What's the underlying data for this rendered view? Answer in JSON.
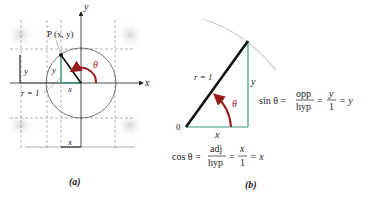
{
  "colors": {
    "angle": "#9b1c1c",
    "legs": "#3a9a7a",
    "radius": "#111111",
    "grid": "#9a9a9a",
    "circle": "#555555",
    "arc_b": "#cccccc"
  },
  "panel_a": {
    "caption": "(a)",
    "point_label": "P (x, y)",
    "axis_x": "x",
    "axis_y": "y",
    "theta": "θ",
    "radius_label": "r = 1",
    "leg_x": "x",
    "leg_y": "y",
    "bracket_y": "y",
    "bracket_x": "x"
  },
  "panel_b": {
    "caption": "(b)",
    "origin": "0",
    "radius_label": "r = 1",
    "theta": "θ",
    "leg_x": "x",
    "leg_y": "y",
    "sin_eq": {
      "lhs": "sin θ =",
      "frac1_num": "opp",
      "frac1_den": "hyp",
      "eq1": "=",
      "frac2_num": "y",
      "frac2_den": "1",
      "rhs": "= y"
    },
    "cos_eq": {
      "lhs": "cos θ =",
      "frac1_num": "adj",
      "frac1_den": "hyp",
      "eq1": "=",
      "frac2_num": "x",
      "frac2_den": "1",
      "rhs": "= x"
    }
  }
}
